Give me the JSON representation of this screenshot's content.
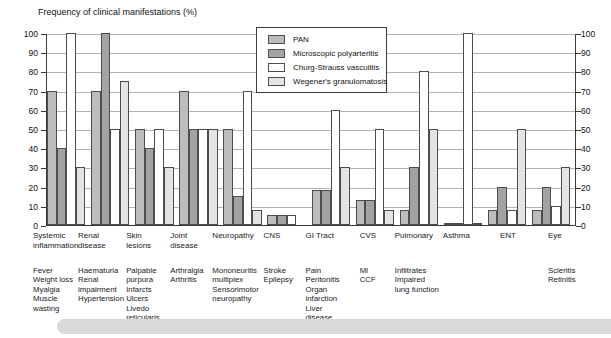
{
  "title": "Frequency of clinical manifestations (%)",
  "chart_data": {
    "type": "bar",
    "title": "Frequency of clinical manifestations (%)",
    "ylim": [
      0,
      100
    ],
    "yticks": [
      0,
      10,
      20,
      30,
      40,
      50,
      60,
      70,
      80,
      90,
      100
    ],
    "grid": true,
    "legend_position": "top-center",
    "dual_y_axis": true,
    "categories": [
      "Systemic inflammation",
      "Renal disease",
      "Skin lesions",
      "Joint disease",
      "Neuropathy",
      "CNS",
      "GI Tract",
      "CVS",
      "Pulmonary",
      "Asthma",
      "ENT",
      "Eye"
    ],
    "sub_labels": [
      [
        "Fever",
        "Weight loss",
        "Myalgia",
        "Muscle",
        "wasting"
      ],
      [
        "Haematuria",
        "Renal",
        "impairment",
        "Hypertension"
      ],
      [
        "Palpable",
        "purpura",
        "Infarcts",
        "Ulcers",
        "Livedo",
        "reticularis"
      ],
      [
        "Arthralgia",
        "Arthritis"
      ],
      [
        "Mononeuritis",
        "multiplex",
        "Sensorimotor",
        "neuropathy"
      ],
      [
        "Stroke",
        "Epilepsy"
      ],
      [
        "Pain",
        "Peritonitis",
        "Organ",
        "infarction",
        "Liver",
        "disease"
      ],
      [
        "MI",
        "CCF"
      ],
      [
        "Infiltrates",
        "Impaired",
        "lung function"
      ],
      [],
      [],
      [
        "Scleritis",
        "Retinitis"
      ]
    ],
    "series": [
      {
        "name": "PAN",
        "color": "#bcbcbc",
        "values": [
          70,
          70,
          50,
          70,
          50,
          5,
          18,
          13,
          8,
          1,
          8,
          8
        ]
      },
      {
        "name": "Microscopic polyarteritis",
        "color": "#a3a3a3",
        "values": [
          40,
          100,
          40,
          50,
          15,
          5,
          18,
          13,
          30,
          1,
          20,
          20
        ]
      },
      {
        "name": "Churg-Strauss vasculitis",
        "color": "#ffffff",
        "values": [
          100,
          50,
          50,
          50,
          70,
          5,
          60,
          50,
          80,
          100,
          8,
          10
        ]
      },
      {
        "name": "Wegener's granulomatosis",
        "color": "#e4e4e4",
        "values": [
          30,
          75,
          30,
          50,
          8,
          0,
          30,
          8,
          50,
          1,
          50,
          30
        ]
      }
    ]
  }
}
